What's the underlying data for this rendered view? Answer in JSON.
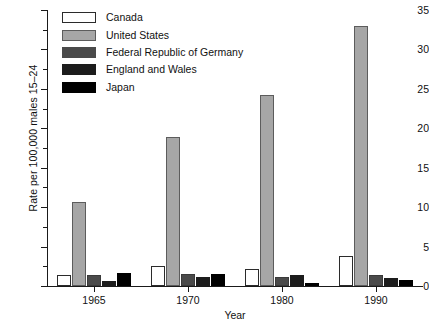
{
  "chart_data": {
    "type": "bar",
    "title": "",
    "xlabel": "Year",
    "ylabel": "Rate per 100,000 males 15–24",
    "categories": [
      "1965",
      "1970",
      "1980",
      "1990"
    ],
    "ylim": [
      0,
      35
    ],
    "yticks": [
      0,
      5,
      10,
      15,
      20,
      25,
      30,
      35
    ],
    "ytick_labels": [
      "0",
      "5",
      "10",
      "15",
      "20",
      "25",
      "30",
      "35"
    ],
    "yticks_minor": [
      2.5,
      7.5,
      12.5,
      17.5,
      22.5,
      27.5,
      32.5
    ],
    "grid": false,
    "legend_position": "top-left",
    "series": [
      {
        "name": "Canada",
        "color": "#ffffff",
        "edge_color": "#2b2b2b",
        "values": [
          1.4,
          2.6,
          2.2,
          3.8
        ]
      },
      {
        "name": "United States",
        "color": "#a6a6a6",
        "edge_color": "#5c5c5c",
        "values": [
          10.6,
          18.9,
          24.2,
          33.0
        ]
      },
      {
        "name": "Federal Republic of Germany",
        "color": "#4a4a4a",
        "edge_color": "#3a3a3a",
        "values": [
          1.4,
          1.5,
          1.1,
          1.4
        ]
      },
      {
        "name": "England and Wales",
        "color": "#1c1c1c",
        "edge_color": "#1c1c1c",
        "values": [
          0.6,
          1.1,
          1.4,
          1.0
        ]
      },
      {
        "name": "Japan",
        "color": "#000000",
        "edge_color": "#000000",
        "values": [
          1.7,
          1.5,
          0.4,
          0.7
        ]
      }
    ]
  },
  "axes": {
    "y_title": "Rate per 100,000 males 15–24",
    "x_title": "Year",
    "y_tick_labels": [
      "35",
      "30",
      "25",
      "20",
      "15",
      "10",
      "5",
      "0"
    ],
    "x_tick_labels": [
      "1965",
      "1970",
      "1980",
      "1990"
    ]
  },
  "legend": {
    "items": [
      {
        "label": "Canada",
        "swatch": "#ffffff"
      },
      {
        "label": "United States",
        "swatch": "#a6a6a6"
      },
      {
        "label": "Federal Republic of Germany",
        "swatch": "#4a4a4a"
      },
      {
        "label": "England and Wales",
        "swatch": "#1c1c1c"
      },
      {
        "label": "Japan",
        "swatch": "#000000"
      }
    ]
  }
}
